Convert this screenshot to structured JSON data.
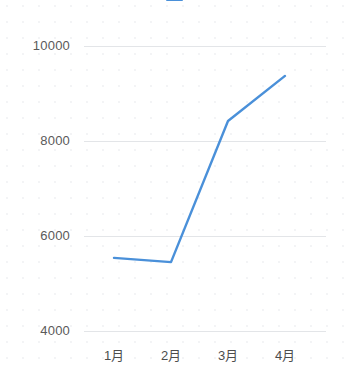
{
  "chart_data": {
    "type": "line",
    "title": "",
    "xlabel": "",
    "ylabel": "",
    "categories": [
      "1月",
      "2月",
      "3月",
      "4月"
    ],
    "series": [
      {
        "name": "",
        "color": "#4a90d9",
        "values": [
          5540,
          5450,
          8420,
          9370
        ]
      }
    ],
    "yticks": [
      10000,
      8000,
      6000,
      4000
    ],
    "ylim": [
      4000,
      10000
    ],
    "grid": true,
    "grid_color": "#e3e5e8",
    "legend_position": "top-center",
    "markers": false,
    "background": "#ffffff"
  },
  "legend": {
    "entries": [
      {
        "marker": "line",
        "label": ""
      },
      {
        "marker": "swatch",
        "label": ""
      }
    ],
    "note_clipped": true
  },
  "axis": {
    "y_labels": [
      "10000",
      "8000",
      "6000",
      "4000"
    ],
    "x_labels": [
      "1月",
      "2月",
      "3月",
      "4月"
    ]
  }
}
